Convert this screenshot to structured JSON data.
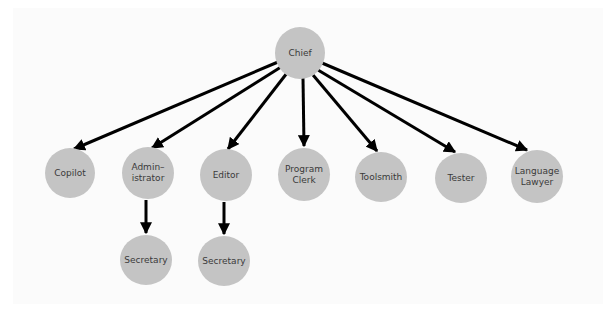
{
  "diagram": {
    "type": "organization-chart",
    "colors": {
      "node_fill": "#c4c4c4",
      "node_text": "#3a3a3a",
      "edge": "#000000",
      "background": "#fbfbfb"
    },
    "nodes": {
      "chief": {
        "label": "Chief",
        "cx": 300,
        "cy": 52,
        "r": 25
      },
      "copilot": {
        "label": "Copilot",
        "cx": 70,
        "cy": 173,
        "r": 25
      },
      "administrator": {
        "label": "Admin–\nistrator",
        "cx": 148,
        "cy": 173,
        "r": 26
      },
      "editor": {
        "label": "Editor",
        "cx": 226,
        "cy": 175,
        "r": 26
      },
      "program_clerk": {
        "label": "Program\nClerk",
        "cx": 304,
        "cy": 174,
        "r": 26
      },
      "toolsmith": {
        "label": "Toolsmith",
        "cx": 381,
        "cy": 177,
        "r": 26
      },
      "tester": {
        "label": "Tester",
        "cx": 461,
        "cy": 178,
        "r": 26
      },
      "language_lawyer": {
        "label": "Language\nLawyer",
        "cx": 537,
        "cy": 176,
        "r": 26
      },
      "secretary_admin": {
        "label": "Secretary",
        "cx": 146,
        "cy": 260,
        "r": 26
      },
      "secretary_editor": {
        "label": "Secretary",
        "cx": 224,
        "cy": 261,
        "r": 26
      }
    },
    "edges": [
      {
        "from": "Chief",
        "to": "Copilot"
      },
      {
        "from": "Chief",
        "to": "Administrator"
      },
      {
        "from": "Chief",
        "to": "Editor"
      },
      {
        "from": "Chief",
        "to": "Program Clerk"
      },
      {
        "from": "Chief",
        "to": "Toolsmith"
      },
      {
        "from": "Chief",
        "to": "Tester"
      },
      {
        "from": "Chief",
        "to": "Language Lawyer"
      },
      {
        "from": "Administrator",
        "to": "Secretary"
      },
      {
        "from": "Editor",
        "to": "Secretary"
      }
    ]
  }
}
